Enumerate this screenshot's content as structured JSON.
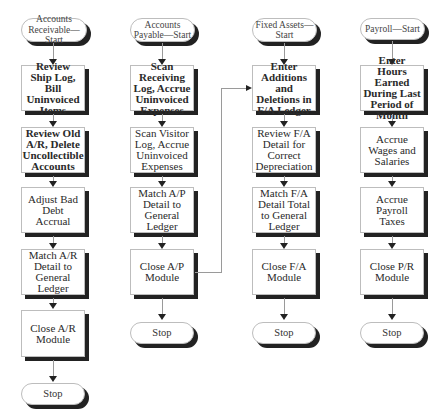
{
  "flowchart": {
    "columns": [
      {
        "id": "accounts-receivable",
        "start": "Accounts Receivable—Start",
        "start_lines": [
          "Accounts",
          "Receivable—Start"
        ],
        "steps": [
          "Review Ship Log, Bill Uninvoiced Items",
          "Review Old A/R, Delete Uncollectible Accounts",
          "Adjust Bad Debt Accrual",
          "Match A/R Detail to General Ledger",
          "Close A/R Module"
        ],
        "end": "Stop"
      },
      {
        "id": "accounts-payable",
        "start": "Accounts Payable—Start",
        "start_lines": [
          "Accounts",
          "Payable—Start"
        ],
        "steps": [
          "Scan Receiving Log, Accrue Uninvoiced Expenses",
          "Scan Visitor Log, Accrue Uninvoiced Expenses",
          "Match A/P Detail to General Ledger",
          "Close A/P Module"
        ],
        "end": "Stop"
      },
      {
        "id": "fixed-assets",
        "start": "Fixed Assets—Start",
        "start_lines": [
          "Fixed",
          "Assets—Start"
        ],
        "steps": [
          "Enter Additions and Deletions in F/A Ledger",
          "Review F/A Detail for Correct Depreciation",
          "Match F/A Detail Total to General Ledger",
          "Close F/A Module"
        ],
        "end": "Stop"
      },
      {
        "id": "payroll",
        "start": "Payroll—Start",
        "start_lines": [
          "Payroll—Start"
        ],
        "steps": [
          "Enter Hours Earned During Last Period of Month",
          "Accrue Wages and Salaries",
          "Accrue Payroll Taxes",
          "Close P/R Module"
        ],
        "end": "Stop"
      }
    ],
    "cross_connections": [
      {
        "from": "Close A/P Module",
        "to": "Enter Additions and Deletions in F/A Ledger"
      }
    ]
  }
}
